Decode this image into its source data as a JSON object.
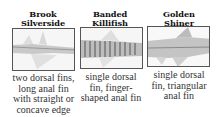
{
  "fish": [
    {
      "name_line1": "Brook",
      "name_line2": "Silverside",
      "description_lines": [
        "two dorsal fins,",
        "long anal fin",
        "with straight or",
        "concave edge"
      ],
      "image_icon": "brook-silverside-image"
    },
    {
      "name_line1": "Banded",
      "name_line2": "Killifish",
      "description_lines": [
        "single dorsal",
        "fin, finger-",
        "shaped anal fin"
      ],
      "image_icon": "banded-killifish-image"
    },
    {
      "name_line1": "Golden",
      "name_line2": "Shiner",
      "description_lines": [
        "single dorsal",
        "fin, triangular",
        "anal fin"
      ],
      "image_icon": "golden-shiner-image"
    }
  ]
}
